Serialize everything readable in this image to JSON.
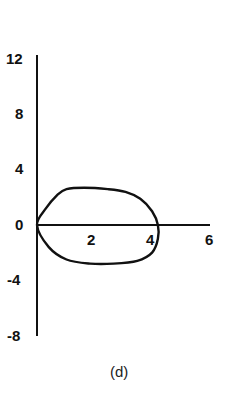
{
  "chart_data": {
    "type": "line",
    "title": "",
    "caption": "(d)",
    "xlabel": "",
    "ylabel": "",
    "xlim": [
      0,
      6
    ],
    "ylim": [
      -8,
      12
    ],
    "x_ticks": [
      2,
      4,
      6
    ],
    "y_ticks": [
      12,
      8,
      4,
      0,
      -4,
      -8
    ],
    "grid": false,
    "legend": null,
    "series": [
      {
        "name": "closed loop",
        "closed": true,
        "points": [
          [
            0,
            0
          ],
          [
            0.3,
            1.2
          ],
          [
            0.7,
            2.2
          ],
          [
            1.0,
            2.6
          ],
          [
            1.6,
            2.7
          ],
          [
            2.4,
            2.6
          ],
          [
            3.0,
            2.4
          ],
          [
            3.5,
            1.9
          ],
          [
            3.9,
            1.0
          ],
          [
            4.1,
            0
          ],
          [
            4.1,
            -1.0
          ],
          [
            3.9,
            -2.0
          ],
          [
            3.4,
            -2.6
          ],
          [
            2.6,
            -2.8
          ],
          [
            1.8,
            -2.8
          ],
          [
            1.0,
            -2.5
          ],
          [
            0.4,
            -1.6
          ],
          [
            0,
            0
          ]
        ]
      }
    ]
  },
  "labels": {
    "y": [
      "12",
      "8",
      "4",
      "0",
      "-4",
      "-8"
    ],
    "x": [
      "2",
      "4",
      "6"
    ],
    "caption": "(d)"
  }
}
